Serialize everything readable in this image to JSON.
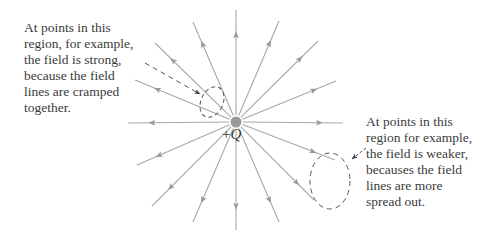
{
  "diagram": {
    "charge": {
      "sign": "+",
      "symbol": "Q",
      "center": [
        236,
        122
      ],
      "color": "#9a9a9a"
    },
    "field_line_color": "#a8a8a8",
    "annotation_color": "#555555",
    "field_lines": [
      {
        "name": "N",
        "end": [
          236,
          10
        ]
      },
      {
        "name": "NNE",
        "end": [
          279,
          21
        ]
      },
      {
        "name": "NE",
        "end": [
          318,
          41
        ]
      },
      {
        "name": "ENE",
        "end": [
          336,
          81
        ]
      },
      {
        "name": "E",
        "end": [
          343,
          123
        ]
      },
      {
        "name": "ESE",
        "end": [
          335,
          160
        ]
      },
      {
        "name": "SE",
        "end": [
          314,
          200
        ]
      },
      {
        "name": "SSE",
        "end": [
          279,
          222
        ]
      },
      {
        "name": "S",
        "end": [
          236,
          230
        ]
      },
      {
        "name": "SSW",
        "end": [
          193,
          222
        ]
      },
      {
        "name": "SW",
        "end": [
          152,
          206
        ]
      },
      {
        "name": "WSW",
        "end": [
          137,
          165
        ]
      },
      {
        "name": "W",
        "end": [
          128,
          123
        ]
      },
      {
        "name": "WNW",
        "end": [
          135,
          80
        ]
      },
      {
        "name": "NW",
        "end": [
          155,
          43
        ]
      },
      {
        "name": "NNW",
        "end": [
          193,
          22
        ]
      }
    ],
    "strong_region": {
      "lines": [
        "At points in this",
        "region, for example,",
        "the field is strong,",
        "because the field",
        "lines are cramped",
        "together."
      ]
    },
    "weak_region": {
      "lines": [
        "At points in this",
        "region for example,",
        "the field is weaker,",
        "becauses the field",
        "lines are more",
        "spread out."
      ]
    }
  }
}
